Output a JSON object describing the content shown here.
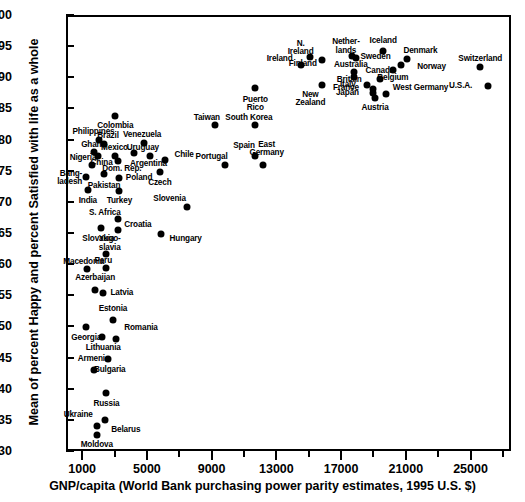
{
  "chart_data": {
    "type": "scatter",
    "title": "",
    "xlabel": "GNP/capita (World Bank purchasing power parity estimates, 1995 U.S. $)",
    "ylabel": "Mean of percent Happy and percent Satisfied with life as a whole",
    "xlim": [
      0,
      27500
    ],
    "ylim": [
      30,
      100
    ],
    "xticks": [
      1000,
      5000,
      9000,
      13000,
      17000,
      21000,
      25000
    ],
    "xticklabels": [
      "1000",
      "5000",
      "9000",
      "13000",
      "17000",
      "21000",
      "25000"
    ],
    "xminorticks": [
      3000,
      7000,
      11000,
      15000,
      19000,
      23000,
      27000
    ],
    "yticks": [
      30,
      35,
      40,
      45,
      50,
      55,
      60,
      65,
      70,
      75,
      80,
      85,
      90,
      95,
      100
    ],
    "yticklabels": [
      "30",
      "35",
      "40",
      "45",
      "50",
      "55",
      "60",
      "65",
      "70",
      "75",
      "80",
      "85",
      "90",
      "95",
      "100"
    ],
    "grid": false,
    "legend": false,
    "marker_color": "#000000",
    "points": [
      {
        "label": "Moldova",
        "x": 1900,
        "y": 32.5,
        "lx": 1900,
        "ly": 30.9,
        "anchor": "c"
      },
      {
        "label": "Belarus",
        "x": 2400,
        "y": 35.0,
        "lx": 2800,
        "ly": 33.3,
        "anchor": "l"
      },
      {
        "label": "Ukraine",
        "x": 1900,
        "y": 34.0,
        "lx": 1650,
        "ly": 35.8,
        "anchor": "r"
      },
      {
        "label": "Russia",
        "x": 2500,
        "y": 39.3,
        "lx": 2500,
        "ly": 37.6,
        "anchor": "c"
      },
      {
        "label": "Armenia",
        "x": 1700,
        "y": 43.0,
        "lx": 1700,
        "ly": 44.8,
        "anchor": "c"
      },
      {
        "label": "Bulgaria",
        "x": 2600,
        "y": 44.8,
        "lx": 2700,
        "ly": 43.0,
        "anchor": "c"
      },
      {
        "label": "Lithuania",
        "x": 2200,
        "y": 48.3,
        "lx": 2300,
        "ly": 46.6,
        "anchor": "c"
      },
      {
        "label": "Georgia",
        "x": 1250,
        "y": 49.9,
        "lx": 1250,
        "ly": 48.2,
        "anchor": "c"
      },
      {
        "label": "Romania",
        "x": 3100,
        "y": 48.0,
        "lx": 3600,
        "ly": 49.7,
        "anchor": "l"
      },
      {
        "label": "Estonia",
        "x": 2900,
        "y": 51.0,
        "lx": 2900,
        "ly": 52.8,
        "anchor": "c"
      },
      {
        "label": "Latvia",
        "x": 2300,
        "y": 55.4,
        "lx": 2750,
        "ly": 55.4,
        "anchor": "l"
      },
      {
        "label": "Azerbaijan",
        "x": 1800,
        "y": 55.9,
        "lx": 1800,
        "ly": 57.7,
        "anchor": "c"
      },
      {
        "label": "Macedonia",
        "x": 1300,
        "y": 59.3,
        "lx": 1100,
        "ly": 60.4,
        "anchor": "c"
      },
      {
        "label": "Peru",
        "x": 2500,
        "y": 59.4,
        "lx": 2300,
        "ly": 60.5,
        "anchor": "c"
      },
      {
        "label": "Yugo-slavia",
        "x": 2450,
        "y": 61.7,
        "lx": 2700,
        "ly": 64.0,
        "anchor": "c"
      },
      {
        "label": "Slovakia",
        "x": 2150,
        "y": 65.8,
        "lx": 2000,
        "ly": 64.0,
        "anchor": "c"
      },
      {
        "label": "Hungary",
        "x": 5900,
        "y": 64.8,
        "lx": 6400,
        "ly": 64.0,
        "anchor": "l"
      },
      {
        "label": "Croatia",
        "x": 3200,
        "y": 65.5,
        "lx": 3600,
        "ly": 66.3,
        "anchor": "l"
      },
      {
        "label": "S. Africa",
        "x": 3200,
        "y": 67.3,
        "lx": 2400,
        "ly": 68.2,
        "anchor": "c"
      },
      {
        "label": "Slovenia",
        "x": 7500,
        "y": 69.2,
        "lx": 6400,
        "ly": 70.5,
        "anchor": "c"
      },
      {
        "label": "India",
        "x": 1350,
        "y": 71.9,
        "lx": 1350,
        "ly": 70.1,
        "anchor": "c"
      },
      {
        "label": "Turkey",
        "x": 3300,
        "y": 71.8,
        "lx": 3300,
        "ly": 70.1,
        "anchor": "c"
      },
      {
        "label": "Bang-ladesh",
        "x": 1250,
        "y": 74.0,
        "lx": 1000,
        "ly": 74.5,
        "anchor": "r"
      },
      {
        "label": "Pakistan",
        "x": 2350,
        "y": 74.4,
        "lx": 2350,
        "ly": 72.6,
        "anchor": "c"
      },
      {
        "label": "Poland",
        "x": 3300,
        "y": 73.9,
        "lx": 3700,
        "ly": 73.9,
        "anchor": "l"
      },
      {
        "label": "Czech",
        "x": 5800,
        "y": 74.8,
        "lx": 5800,
        "ly": 73.0,
        "anchor": "c"
      },
      {
        "label": "Portugal",
        "x": 9800,
        "y": 75.9,
        "lx": 9000,
        "ly": 77.2,
        "anchor": "c"
      },
      {
        "label": "East Germany",
        "x": 12200,
        "y": 75.9,
        "lx": 12400,
        "ly": 79.2,
        "anchor": "c"
      },
      {
        "label": "Nigeria",
        "x": 1600,
        "y": 75.9,
        "lx": 1050,
        "ly": 77.1,
        "anchor": "c"
      },
      {
        "label": "Dom. Rep.",
        "x": 3200,
        "y": 76.5,
        "lx": 3450,
        "ly": 75.3,
        "anchor": "c"
      },
      {
        "label": "Chile",
        "x": 6100,
        "y": 76.8,
        "lx": 6700,
        "ly": 77.6,
        "anchor": "l"
      },
      {
        "label": "Spain",
        "x": 11700,
        "y": 77.4,
        "lx": 11000,
        "ly": 79.0,
        "anchor": "c"
      },
      {
        "label": "Argentina",
        "x": 5200,
        "y": 77.4,
        "lx": 5100,
        "ly": 76.1,
        "anchor": "c"
      },
      {
        "label": "China",
        "x": 1950,
        "y": 77.4,
        "lx": 2200,
        "ly": 76.2,
        "anchor": "c"
      },
      {
        "label": "Mexico",
        "x": 3000,
        "y": 77.3,
        "lx": 3000,
        "ly": 78.6,
        "anchor": "c"
      },
      {
        "label": "Uruguay",
        "x": 4200,
        "y": 77.9,
        "lx": 4750,
        "ly": 78.6,
        "anchor": "c"
      },
      {
        "label": "Ghana",
        "x": 1700,
        "y": 78.0,
        "lx": 1700,
        "ly": 79.2,
        "anchor": "c"
      },
      {
        "label": "Brazil",
        "x": 2350,
        "y": 79.3,
        "lx": 2600,
        "ly": 80.5,
        "anchor": "c"
      },
      {
        "label": "Venezuela",
        "x": 4800,
        "y": 79.5,
        "lx": 4700,
        "ly": 80.8,
        "anchor": "c"
      },
      {
        "label": "Philippines",
        "x": 2050,
        "y": 80.0,
        "lx": 1700,
        "ly": 81.2,
        "anchor": "c"
      },
      {
        "label": "South Korea",
        "x": 11700,
        "y": 82.3,
        "lx": 11300,
        "ly": 83.4,
        "anchor": "c"
      },
      {
        "label": "Taiwan",
        "x": 9200,
        "y": 82.4,
        "lx": 8700,
        "ly": 83.4,
        "anchor": "c"
      },
      {
        "label": "Colombia",
        "x": 3050,
        "y": 83.8,
        "lx": 3050,
        "ly": 82.2,
        "anchor": "c"
      },
      {
        "label": "Puerto Rico",
        "x": 11700,
        "y": 88.2,
        "lx": 11700,
        "ly": 86.4,
        "anchor": "c"
      },
      {
        "label": "New Zealand",
        "x": 15800,
        "y": 88.8,
        "lx": 15100,
        "ly": 87.2,
        "anchor": "c"
      },
      {
        "label": "U.S.A.",
        "x": 26100,
        "y": 88.6,
        "lx": 25100,
        "ly": 88.6,
        "anchor": "r"
      },
      {
        "label": "Austria",
        "x": 19100,
        "y": 86.7,
        "lx": 19100,
        "ly": 85.1,
        "anchor": "c"
      },
      {
        "label": "Japan",
        "x": 18950,
        "y": 87.4,
        "lx": 18100,
        "ly": 87.4,
        "anchor": "r"
      },
      {
        "label": "France",
        "x": 18950,
        "y": 88.1,
        "lx": 18100,
        "ly": 88.3,
        "anchor": "r"
      },
      {
        "label": "West Germany",
        "x": 19800,
        "y": 87.3,
        "lx": 20200,
        "ly": 88.2,
        "anchor": "l"
      },
      {
        "label": "Italy",
        "x": 18600,
        "y": 88.8,
        "lx": 17900,
        "ly": 88.8,
        "anchor": "r"
      },
      {
        "label": "Canada",
        "x": 19400,
        "y": 89.7,
        "lx": 19400,
        "ly": 91.0,
        "anchor": "c"
      },
      {
        "label": "Britain",
        "x": 17800,
        "y": 90.1,
        "lx": 17500,
        "ly": 89.6,
        "anchor": "c"
      },
      {
        "label": "Australia",
        "x": 17800,
        "y": 90.8,
        "lx": 17600,
        "ly": 92.0,
        "anchor": "c"
      },
      {
        "label": "Belgium",
        "x": 20200,
        "y": 91.1,
        "lx": 20200,
        "ly": 89.9,
        "anchor": "c"
      },
      {
        "label": "Norway",
        "x": 20700,
        "y": 91.9,
        "lx": 21700,
        "ly": 91.6,
        "anchor": "l"
      },
      {
        "label": "Ireland",
        "x": 14500,
        "y": 91.9,
        "lx": 14000,
        "ly": 93.0,
        "anchor": "r"
      },
      {
        "label": "Finland",
        "x": 15800,
        "y": 92.8,
        "lx": 15500,
        "ly": 92.2,
        "anchor": "r"
      },
      {
        "label": "Switzerland",
        "x": 25600,
        "y": 91.6,
        "lx": 25600,
        "ly": 93.0,
        "anchor": "c"
      },
      {
        "label": "Denmark",
        "x": 21100,
        "y": 93.0,
        "lx": 21900,
        "ly": 94.2,
        "anchor": "c"
      },
      {
        "label": "Sweden",
        "x": 17900,
        "y": 93.1,
        "lx": 18200,
        "ly": 93.2,
        "anchor": "l"
      },
      {
        "label": "N. Ireland",
        "x": 15100,
        "y": 93.3,
        "lx": 14500,
        "ly": 95.4,
        "anchor": "c"
      },
      {
        "label": "Nether-lands",
        "x": 17700,
        "y": 93.4,
        "lx": 17300,
        "ly": 95.6,
        "anchor": "c"
      },
      {
        "label": "Iceland",
        "x": 19600,
        "y": 94.3,
        "lx": 19600,
        "ly": 95.8,
        "anchor": "c"
      }
    ]
  },
  "axis": {
    "x_title": "GNP/capita (World Bank purchasing power parity estimates, 1995 U.S. $)",
    "y_title": "Mean of percent Happy and percent Satisfied with life as a whole"
  }
}
